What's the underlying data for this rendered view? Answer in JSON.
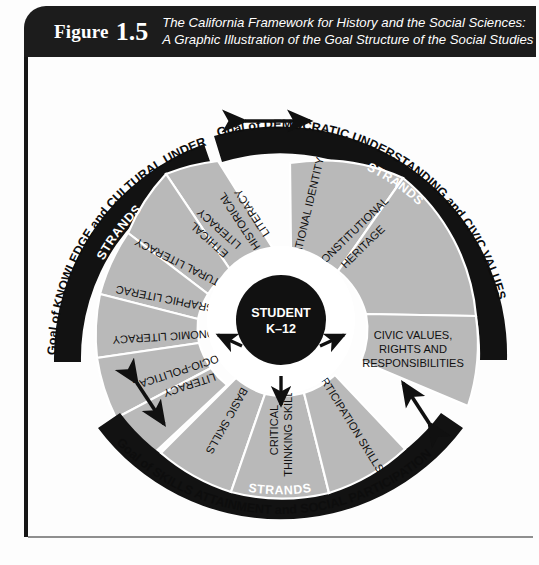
{
  "figure": {
    "label": "Figure",
    "number": "1.5",
    "caption_line1": "The California Framework for History and the Social Sciences:",
    "caption_line2": "A Graphic Illustration of the Goal Structure of the Social Studies"
  },
  "colors": {
    "banner_bg": "#1c1c1c",
    "arc_black": "#121212",
    "sector_gray": "#b9b9b9",
    "sector_divider": "#ffffff",
    "text_dark": "#111111",
    "text_light": "#ffffff",
    "page_bg": "#fdfdfd"
  },
  "center": {
    "line1": "STUDENT",
    "line2": "K–12"
  },
  "goals": [
    {
      "id": "knowledge",
      "goal_text": "Goal of KNOWLEDGE and CULTURAL UNDERSTANDING",
      "strands_label": "STRANDS",
      "strands": [
        "HISTORICAL LITERACY",
        "ETHICAL LITERACY",
        "CULTURAL LITERACY",
        "GEOGRAPHIC LITERACY",
        "ECONOMIC LITERACY",
        "SOCIO-POLITICAL LITERACY"
      ]
    },
    {
      "id": "democratic",
      "goal_text": "Goal of DEMOCRATIC UNDERSTANDING and CIVIC VALUES",
      "strands_label": "STRANDS",
      "strands": [
        "NATIONAL IDENTITY",
        "CONSTITUTIONAL HERITAGE",
        "CIVIC VALUES, RIGHTS AND RESPONSIBILITIES"
      ]
    },
    {
      "id": "skills",
      "goal_text": "Goal of SKILLS ATTAINMENT and SOCIAL PARTICIPATION",
      "strands_label": "STRANDS",
      "strands": [
        "BASIC SKILLS",
        "CRITICAL THINKING SKILLS",
        "PARTICIPATION SKILLS"
      ]
    }
  ],
  "connectors": [
    {
      "id": "knowledge-democratic",
      "type": "double-arrow-horizontal"
    },
    {
      "id": "democratic-skills",
      "type": "double-arrow-diagonal"
    },
    {
      "id": "skills-knowledge",
      "type": "double-arrow-diagonal"
    },
    {
      "id": "center-to-knowledge",
      "type": "single-arrow"
    },
    {
      "id": "center-to-democratic",
      "type": "single-arrow"
    },
    {
      "id": "center-to-skills",
      "type": "single-arrow"
    }
  ],
  "sector_texts": {
    "knowledge": {
      "s0a": "HISTORICAL",
      "s0b": "LITERACY",
      "s1a": "ETHICAL",
      "s1b": "LITERACY",
      "s2a": "CULTURAL LITERACY",
      "s3a": "GEOGRAPHIC LITERACY",
      "s4a": "ECONOMIC LITERACY",
      "s5a": "SOCIO-POLITICAL",
      "s5b": "LITERACY"
    },
    "democratic": {
      "s0a": "NATIONAL IDENTITY",
      "s1a": "CONSTITUTIONAL",
      "s1b": "HERITAGE",
      "s2a": "CIVIC VALUES,",
      "s2b": "RIGHTS AND",
      "s2c": "RESPONSIBILITIES"
    },
    "skills": {
      "s0a": "BASIC SKILLS",
      "s1a": "CRITICAL",
      "s1b": "THINKING SKILLS",
      "s2a": "PARTICIPATION SKILLS"
    }
  }
}
